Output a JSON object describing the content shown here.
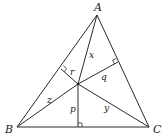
{
  "diagram": {
    "type": "triangle-with-interior-point",
    "colors": {
      "stroke": "#2a2a2a",
      "text": "#1a1a1a",
      "background": "#ffffff"
    },
    "vertices": [
      {
        "id": "A",
        "label": "A",
        "x": 97,
        "y": 15,
        "lx": 98,
        "ly": 11
      },
      {
        "id": "B",
        "label": "B",
        "x": 17,
        "y": 127,
        "lx": 6,
        "ly": 133
      },
      {
        "id": "C",
        "label": "C",
        "x": 149,
        "y": 127,
        "lx": 153,
        "ly": 133
      }
    ],
    "interior_point": {
      "x": 78,
      "y": 84
    },
    "distance_labels": [
      {
        "name": "x",
        "label": "x",
        "x": 89,
        "y": 58,
        "meaning": "PA"
      },
      {
        "name": "y",
        "label": "y",
        "x": 104,
        "y": 111,
        "meaning": "PC"
      },
      {
        "name": "z",
        "label": "z",
        "x": 47,
        "y": 103,
        "meaning": "PB"
      },
      {
        "name": "p",
        "label": "p",
        "x": 70,
        "y": 112,
        "meaning": "perpendicular to BC"
      },
      {
        "name": "q",
        "label": "q",
        "x": 101,
        "y": 80,
        "meaning": "perpendicular to AC"
      },
      {
        "name": "r",
        "label": "r",
        "x": 70,
        "y": 75,
        "meaning": "perpendicular to AB"
      }
    ],
    "feet": {
      "BC": {
        "x": 78,
        "y": 127
      },
      "AB": {
        "x": 61,
        "y": 69
      },
      "AC": {
        "x": 118,
        "y": 62
      }
    }
  }
}
